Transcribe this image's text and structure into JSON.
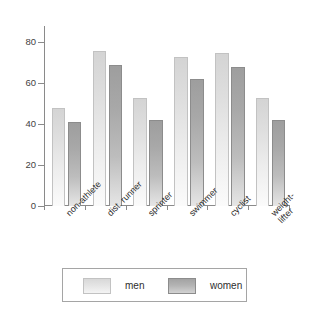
{
  "chart_data": {
    "type": "bar",
    "title": "",
    "subtitle": "",
    "xlabel": "",
    "ylabel": "",
    "ylim": [
      0,
      88
    ],
    "yticks": [
      0,
      20,
      40,
      60,
      80
    ],
    "ytick_labels": [
      "0",
      "20",
      "40",
      "60",
      "80"
    ],
    "grid": false,
    "legend_position": "bottom",
    "categories": [
      "non-athlete",
      "dist. runner",
      "sprinter",
      "swimmer",
      "cyclist",
      "weight-\nlifter"
    ],
    "category_labels_flat": [
      "non-athlete",
      "dist. runner",
      "sprinter",
      "swimmer",
      "cyclist",
      "weight-lifter"
    ],
    "series": [
      {
        "name": "men",
        "color": "#e2e2e2",
        "values": [
          48,
          76,
          53,
          73,
          75,
          53
        ]
      },
      {
        "name": "women",
        "color": "#b0b0b0",
        "values": [
          41,
          69,
          42,
          62,
          68,
          42
        ]
      }
    ]
  },
  "legend": {
    "items": [
      {
        "label": "men",
        "swatch": "men-swatch"
      },
      {
        "label": "women",
        "swatch": "women-swatch"
      }
    ]
  },
  "axes": {
    "y": {
      "ticks": [
        "0",
        "20",
        "40",
        "60",
        "80"
      ]
    }
  }
}
